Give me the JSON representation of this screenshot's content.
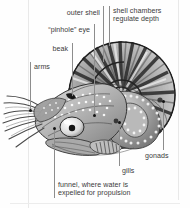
{
  "figure": {
    "style": "grayscale engraving / stipple illustration",
    "background_color": "#fefefe",
    "text_color": "#3b3b3b",
    "leader_color": "#8d8d8d",
    "dot_color": "#141414"
  },
  "labels": [
    {
      "id": "outer-shell",
      "text": "outer shell",
      "align": "right",
      "x": 42,
      "y": 9,
      "w": 60,
      "leader": {
        "type": "vertical",
        "x": 103,
        "y_top": 6,
        "y_bottom": 62
      },
      "dot": null
    },
    {
      "id": "shell-chambers",
      "text": "shell chambers\nregulate depth",
      "align": "left",
      "x": 113,
      "y": 7,
      "w": 72,
      "leader": {
        "type": "vertical",
        "x": 109,
        "y_top": 6,
        "y_bottom": 46
      },
      "dot": null
    },
    {
      "id": "pinhole-eye",
      "text": "“pinhole” eye",
      "align": "right",
      "x": 28,
      "y": 26,
      "w": 62,
      "leader": {
        "type": "vertical",
        "x": 94,
        "y_top": 24,
        "y_bottom": 115
      },
      "dot": {
        "x": 93,
        "y": 114
      }
    },
    {
      "id": "beak",
      "text": "beak",
      "align": "right",
      "x": 40,
      "y": 45,
      "w": 50,
      "leader": {
        "type": "vertical",
        "x": 72,
        "y_top": 43,
        "y_bottom": 97
      },
      "dot": {
        "x": 71,
        "y": 96
      }
    },
    {
      "id": "arms",
      "text": "arms",
      "align": "left",
      "x": 33,
      "y": 63,
      "w": 46,
      "leader": {
        "type": "vertical",
        "x": 30,
        "y_top": 62,
        "y_bottom": 110
      },
      "dot": {
        "x": 29,
        "y": 109
      }
    },
    {
      "id": "gonads",
      "text": "gonads",
      "align": "left",
      "x": 145,
      "y": 152,
      "w": 44,
      "leader": {
        "type": "vertical",
        "x": 163,
        "y_top": 101,
        "y_bottom": 150
      },
      "dot": {
        "x": 162,
        "y": 100
      }
    },
    {
      "id": "gills",
      "text": "gills",
      "align": "left",
      "x": 121,
      "y": 167,
      "w": 30,
      "leader": {
        "type": "vertical",
        "x": 119,
        "y_top": 122,
        "y_bottom": 166
      },
      "dot": {
        "x": 118,
        "y": 121
      }
    },
    {
      "id": "funnel",
      "text": "funnel, where water is\nexpelled for propulsion",
      "align": "left",
      "x": 58,
      "y": 181,
      "w": 104,
      "leader": {
        "type": "vertical",
        "x": 54,
        "y_top": 128,
        "y_bottom": 198
      },
      "dot": {
        "x": 53,
        "y": 127
      }
    }
  ],
  "frame": {
    "left_rule_x": 28,
    "right_rule_x": 178,
    "bottom_rule_y": 203
  },
  "anatomy_parts": [
    "outer shell",
    "shell chambers",
    "“pinhole” eye",
    "beak",
    "arms",
    "gonads",
    "gills",
    "funnel"
  ]
}
